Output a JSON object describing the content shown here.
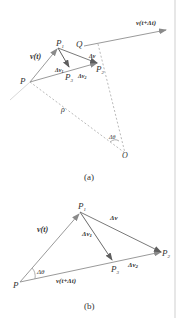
{
  "figure_a": {
    "caption": "(a)",
    "points": {
      "P": "P",
      "P1": "P",
      "P1_sub": "1",
      "P2": "P",
      "P2_sub": "2",
      "P3": "P",
      "P3_sub": "3",
      "Q": "Q",
      "O": "O"
    },
    "labels": {
      "v_t": "v(t)",
      "v_t_dt": "v(t+Δt)",
      "dv": "Δv",
      "dv1": "Δv",
      "dv1_sub": "1",
      "dv2": "Δv",
      "dv2_sub": "2",
      "rho": "ρ",
      "dtheta": "Δθ"
    }
  },
  "figure_b": {
    "caption": "(b)",
    "points": {
      "P": "P",
      "P1": "P",
      "P1_sub": "1",
      "P2": "P",
      "P2_sub": "2",
      "P3": "P",
      "P3_sub": "3"
    },
    "labels": {
      "v_t": "v(t)",
      "v_t_dt": "v(t+Δt)",
      "dv": "Δv",
      "dv1": "Δv",
      "dv1_sub": "1",
      "dv2": "Δv",
      "dv2_sub": "2",
      "dtheta": "Δθ"
    }
  },
  "colors": {
    "line": "#9a9a9a",
    "arrow_dark": "#6f6f6f",
    "text": "#333333",
    "border": "#cfcfcf"
  }
}
